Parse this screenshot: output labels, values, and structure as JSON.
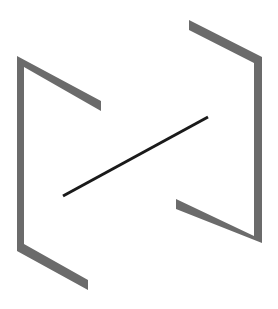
{
  "figure": {
    "colors": {
      "background": "#ffffff",
      "bracket": "#6b6b6b",
      "line": "#1a1a1a"
    },
    "shapes": {
      "left_bracket": {
        "points": "17,56 101,101 101,111 24,67 24,244 88,280 88,290 17,251"
      },
      "right_bracket": {
        "points": "189,20 262,57 262,243 176,209 176,199 254,236 254,63 189,30"
      },
      "center_line": {
        "x1": 63,
        "y1": 196,
        "x2": 208,
        "y2": 117,
        "width": 3
      }
    }
  }
}
